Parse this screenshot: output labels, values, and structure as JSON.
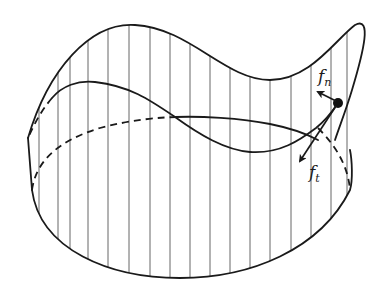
{
  "figure": {
    "labels": {
      "normal_force": {
        "main": "f",
        "sub": "n"
      },
      "tangential_force": {
        "main": "f",
        "sub": "t"
      }
    },
    "colors": {
      "stroke": "#1a1a1a",
      "rulings": "#555555",
      "background": "#ffffff"
    }
  }
}
